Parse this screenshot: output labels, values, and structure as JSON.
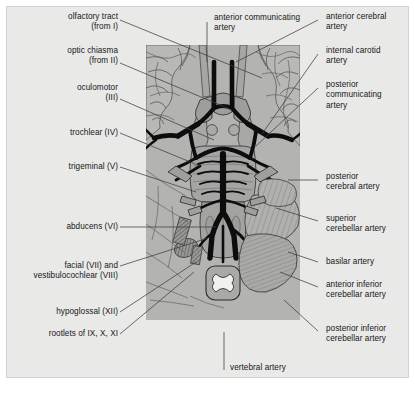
{
  "figure": {
    "kind": "anatomical-illustration",
    "background_color": "#e9e9e7",
    "panel_color": "#b3b3b1",
    "artery_color": "#0d0d0d",
    "outline_color": "#3a3a3a"
  },
  "labels": {
    "left": [
      {
        "id": "olfactory-tract",
        "text": "olfactory tract\n(from I)"
      },
      {
        "id": "optic-chiasma",
        "text": "optic chiasma\n(from II)"
      },
      {
        "id": "oculomotor",
        "text": "oculomotor\n(III)"
      },
      {
        "id": "trochlear",
        "text": "trochlear (IV)"
      },
      {
        "id": "trigeminal",
        "text": "trigeminal (V)"
      },
      {
        "id": "abducens",
        "text": "abducens (VI)"
      },
      {
        "id": "facial-vestibulocochlear",
        "text": "facial (VII) and\nvestibulocochlear (VIII)"
      },
      {
        "id": "hypoglossal",
        "text": "hypoglossal (XII)"
      },
      {
        "id": "rootlets",
        "text": "rootlets of IX, X, XI"
      }
    ],
    "right": [
      {
        "id": "anterior-cerebral-artery",
        "text": "anterior cerebral\nartery"
      },
      {
        "id": "internal-carotid-artery",
        "text": "internal carotid\nartery"
      },
      {
        "id": "posterior-communicating-artery",
        "text": "posterior\ncommunicating\nartery"
      },
      {
        "id": "posterior-cerebral-artery",
        "text": "posterior\ncerebral artery"
      },
      {
        "id": "superior-cerebellar-artery",
        "text": "superior\ncerebellar artery"
      },
      {
        "id": "basilar-artery",
        "text": "basilar artery"
      },
      {
        "id": "anterior-inferior-cerebellar-artery",
        "text": "anterior inferior\ncerebellar artery"
      },
      {
        "id": "posterior-inferior-cerebellar-artery",
        "text": "posterior inferior\ncerebellar artery"
      }
    ],
    "top": [
      {
        "id": "anterior-communicating-artery",
        "text": "anterior communicating\nartery"
      }
    ],
    "bottom": [
      {
        "id": "vertebral-artery",
        "text": "vertebral artery"
      }
    ]
  }
}
